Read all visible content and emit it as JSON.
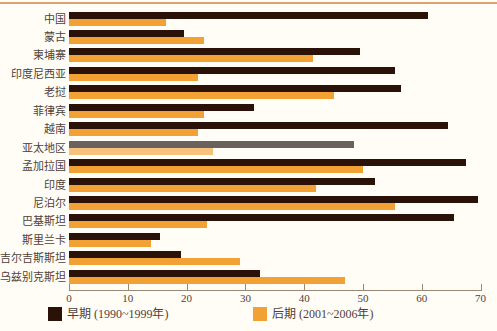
{
  "page": {
    "background": "#fffdf6",
    "top_border_color": "#dca271",
    "axis_color": "#9a8875",
    "text_color": "#50413a"
  },
  "chart_data": {
    "type": "bar",
    "orientation": "horizontal",
    "title": "",
    "xlabel": "",
    "ylabel": "",
    "xlim": [
      0,
      70
    ],
    "xticks": [
      0,
      10,
      20,
      30,
      40,
      50,
      60,
      70
    ],
    "grid": false,
    "legend_position": "bottom",
    "categories": [
      "中国",
      "蒙古",
      "柬埔寨",
      "印度尼西亚",
      "老挝",
      "菲律宾",
      "越南",
      "亚太地区",
      "孟加拉国",
      "印度",
      "尼泊尔",
      "巴基斯坦",
      "斯里兰卡",
      "吉尔吉斯斯坦",
      "乌兹别克斯坦"
    ],
    "series": [
      {
        "name": "早期 (1990~1999年)",
        "color": "#2b1209",
        "values": [
          61,
          19.5,
          49.5,
          55.5,
          56.5,
          31.5,
          64.5,
          48.5,
          67.5,
          52,
          69.5,
          65.5,
          15.5,
          19,
          32.5
        ]
      },
      {
        "name": "后期 (2001~2006年)",
        "color": "#f2a135",
        "values": [
          16.5,
          23,
          41.5,
          22,
          45,
          23,
          22,
          24.5,
          50,
          42,
          55.5,
          23.5,
          14,
          29,
          47
        ]
      }
    ],
    "highlight_category": "亚太地区",
    "highlight_index": 7,
    "highlight_colors": {
      "early": "#6a615c",
      "late": "#f6c17c"
    }
  }
}
